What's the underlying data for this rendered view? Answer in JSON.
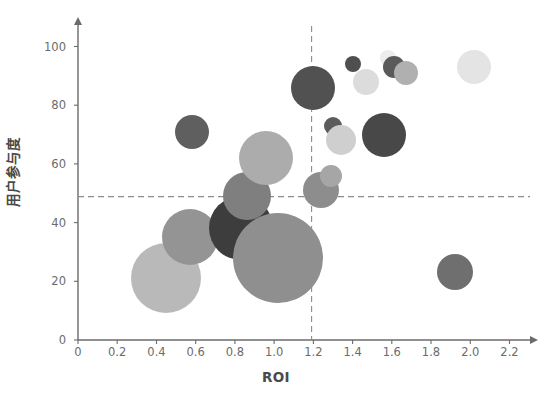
{
  "chart_data": {
    "type": "scatter",
    "subtype": "bubble",
    "title": "",
    "xlabel": "ROI",
    "ylabel": "用户参与度",
    "xlim": [
      0,
      2.3
    ],
    "ylim": [
      0,
      107
    ],
    "xticks": [
      "0",
      "0.2",
      "0.4",
      "0.6",
      "0.8",
      "1.0",
      "1.2",
      "1.4",
      "1.6",
      "1.8",
      "2.0",
      "2.2"
    ],
    "xtick_values": [
      0,
      0.2,
      0.4,
      0.6,
      0.8,
      1.0,
      1.2,
      1.4,
      1.6,
      1.8,
      2.0,
      2.2
    ],
    "yticks": [
      "0",
      "20",
      "40",
      "60",
      "80",
      "100"
    ],
    "ytick_values": [
      0,
      20,
      40,
      60,
      80,
      100
    ],
    "grid": false,
    "legend": "none",
    "axis_style": "arrowed-spines",
    "reference_lines": [
      {
        "orientation": "horizontal",
        "value": 51,
        "style": "dashed",
        "color": "#808080"
      },
      {
        "orientation": "vertical",
        "value": 1.25,
        "style": "dashed",
        "color": "#808080"
      }
    ],
    "size_encoding": "bubble-radius",
    "points": [
      {
        "x": 0.45,
        "y": 21,
        "r": 35,
        "color": "#b9b9b9"
      },
      {
        "x": 0.57,
        "y": 35,
        "r": 28,
        "color": "#949494"
      },
      {
        "x": 0.58,
        "y": 71,
        "r": 17,
        "color": "#5f5f5f"
      },
      {
        "x": 0.83,
        "y": 38,
        "r": 32,
        "color": "#3d3d3d"
      },
      {
        "x": 0.86,
        "y": 49,
        "r": 24,
        "color": "#7f7f7f"
      },
      {
        "x": 0.96,
        "y": 62,
        "r": 27,
        "color": "#acacac"
      },
      {
        "x": 1.02,
        "y": 28,
        "r": 45,
        "color": "#8f8f8f"
      },
      {
        "x": 1.2,
        "y": 86,
        "r": 22,
        "color": "#515151"
      },
      {
        "x": 1.24,
        "y": 51,
        "r": 18,
        "color": "#8d8d8d"
      },
      {
        "x": 1.29,
        "y": 56,
        "r": 11,
        "color": "#a6a6a6"
      },
      {
        "x": 1.3,
        "y": 73,
        "r": 9,
        "color": "#5c5c5c"
      },
      {
        "x": 1.34,
        "y": 68,
        "r": 15,
        "color": "#cfcfcf"
      },
      {
        "x": 1.4,
        "y": 94,
        "r": 8,
        "color": "#4f4f4f"
      },
      {
        "x": 1.47,
        "y": 88,
        "r": 13,
        "color": "#dcdcdc"
      },
      {
        "x": 1.56,
        "y": 70,
        "r": 22,
        "color": "#484848"
      },
      {
        "x": 1.58,
        "y": 96,
        "r": 8,
        "color": "#ededed"
      },
      {
        "x": 1.61,
        "y": 93,
        "r": 11,
        "color": "#5a5a5a"
      },
      {
        "x": 1.67,
        "y": 91,
        "r": 12,
        "color": "#b0b0b0"
      },
      {
        "x": 1.92,
        "y": 23,
        "r": 18,
        "color": "#6f6f6f"
      },
      {
        "x": 2.02,
        "y": 93,
        "r": 17,
        "color": "#e4e4e4"
      }
    ]
  }
}
